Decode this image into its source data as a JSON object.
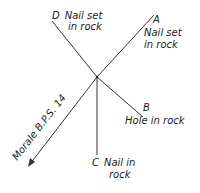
{
  "diagram": {
    "center": {
      "x": 97,
      "y": 77
    },
    "points": [
      {
        "id": "D",
        "letter": "D",
        "line1": "Nail set",
        "line2": "in rock"
      },
      {
        "id": "A",
        "letter": "A",
        "line1": "Nail set",
        "line2": "in rock"
      },
      {
        "id": "B",
        "letter": "B",
        "line1": "Hole in rock"
      },
      {
        "id": "C",
        "letter": "C",
        "line1": "Nail in",
        "line2": "rock"
      }
    ],
    "arrow": {
      "label": "Morale B.P.S. 14"
    }
  }
}
